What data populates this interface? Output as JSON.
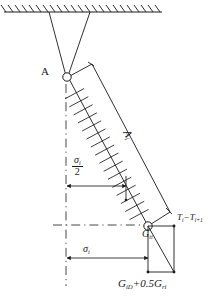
{
  "figure": {
    "background_color": "#ffffff",
    "line_color": "#1a1a1a",
    "width": 212,
    "height": 297
  },
  "labels": {
    "hinge_top": "A",
    "member_axis": "A",
    "member_axis_subscript": "i",
    "sigma_half_numerator": "σ",
    "sigma_half_numerator_subscript": "i",
    "sigma_half_denominator": "2",
    "sigma_i": "σ",
    "sigma_i_subscript": "i",
    "weight_point": "G",
    "weight_point_subscript": "ti",
    "tension_difference": "T",
    "tension_difference_sub_1": "i",
    "tension_difference_operator": "−",
    "tension_difference_term_2": "T",
    "tension_difference_sub_2": "i+1",
    "gravity_load": "G",
    "gravity_load_sub_1": "iD",
    "gravity_load_operator": "+",
    "gravity_load_coefficient": "0.5",
    "gravity_load_term_2": "G",
    "gravity_load_sub_2": "ri"
  },
  "elements": {
    "ceiling_support": "hatched-fixed-support",
    "cable_left": "suspension-cable-left",
    "cable_right": "suspension-cable-right",
    "hinge_top_marker": "pin-hinge-circle",
    "hinge_bottom_marker": "pin-hinge-circle",
    "member_hatched": "inclined-hatched-member",
    "member_outline": "inclined-member-outline",
    "centerline_vertical": "vertical-dash-dot-centerline",
    "centerline_horizontal": "horizontal-dash-dot-line",
    "dimension_sigma_half": "dimension-line-sigma-half",
    "dimension_sigma_i": "dimension-line-sigma-i",
    "force_polygon": "force-rectangle-with-diagonal"
  }
}
